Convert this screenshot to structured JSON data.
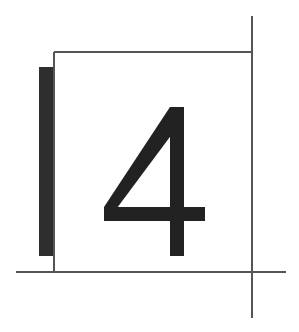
{
  "figure": {
    "digit": "4",
    "colors": {
      "background": "#ffffff",
      "line": "#555555",
      "bar": "#2e2e2e",
      "digit": "#222222"
    }
  }
}
